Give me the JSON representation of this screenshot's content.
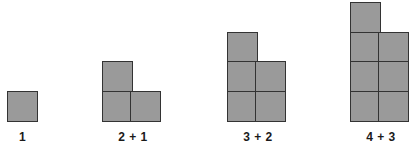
{
  "diagram": {
    "background_color": "#ffffff",
    "cell_fill_color": "#9a9a9a",
    "cell_border_color": "#333333",
    "cell_size_px": 31,
    "baseline_y_px": 122,
    "figures": [
      {
        "caption": "1",
        "total_squares": 1,
        "columns": [
          1
        ],
        "left_px": 7,
        "caption_left_px": 0,
        "caption_width_px": 45
      },
      {
        "caption": "2 + 1",
        "total_squares": 3,
        "columns": [
          2,
          1
        ],
        "left_px": 102,
        "caption_left_px": 95,
        "caption_width_px": 76
      },
      {
        "caption": "3 + 2",
        "total_squares": 5,
        "columns": [
          3,
          2
        ],
        "left_px": 227,
        "caption_left_px": 220,
        "caption_width_px": 76
      },
      {
        "caption": "4 + 3",
        "total_squares": 7,
        "columns": [
          4,
          3
        ],
        "left_px": 350,
        "caption_left_px": 343,
        "caption_width_px": 76
      }
    ]
  }
}
